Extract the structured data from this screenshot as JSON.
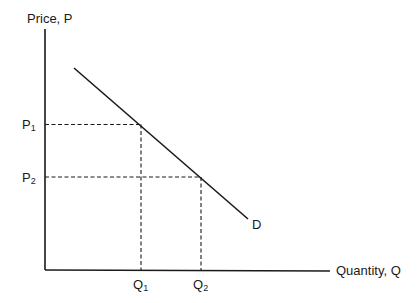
{
  "diagram": {
    "type": "demand-curve",
    "y_axis_label": "Price, P",
    "x_axis_label": "Quantity, Q",
    "curve_label": "D",
    "price_levels": [
      {
        "main": "P",
        "sub": "1"
      },
      {
        "main": "P",
        "sub": "2"
      }
    ],
    "quantity_levels": [
      {
        "main": "Q",
        "sub": "1"
      },
      {
        "main": "Q",
        "sub": "2"
      }
    ],
    "colors": {
      "line": "#1a1a1a",
      "background": "#ffffff"
    }
  }
}
